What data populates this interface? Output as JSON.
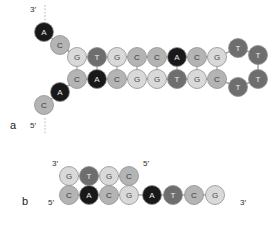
{
  "figure": {
    "panels": [
      {
        "id": "a",
        "letter": "a",
        "letter_x": 10,
        "letter_y": 129,
        "description": "hairpin with single-stranded fork arms",
        "labels": [
          {
            "name": "three-prime-label-a",
            "text": "3′",
            "x": 30,
            "y": 12
          },
          {
            "name": "five-prime-label-a",
            "text": "5′",
            "x": 30,
            "y": 128
          }
        ],
        "dashes": [
          {
            "name": "three-prime-dash-a",
            "x1": 45,
            "y1": 5,
            "x2": 45,
            "y2": 22
          },
          {
            "name": "five-prime-dash-a",
            "x1": 45,
            "y1": 118,
            "x2": 45,
            "y2": 135
          }
        ],
        "bases": [
          {
            "id": "a-t1",
            "base": "A",
            "x": 44,
            "y": 32
          },
          {
            "id": "a-t2",
            "base": "C",
            "x": 60,
            "y": 45
          },
          {
            "id": "a-t3",
            "base": "G",
            "x": 77,
            "y": 57
          },
          {
            "id": "a-t4",
            "base": "T",
            "x": 97,
            "y": 57
          },
          {
            "id": "a-t5",
            "base": "G",
            "x": 117,
            "y": 57
          },
          {
            "id": "a-t6",
            "base": "C",
            "x": 137,
            "y": 57
          },
          {
            "id": "a-t7",
            "base": "C",
            "x": 157,
            "y": 57
          },
          {
            "id": "a-t8",
            "base": "A",
            "x": 177,
            "y": 57
          },
          {
            "id": "a-t9",
            "base": "C",
            "x": 197,
            "y": 57
          },
          {
            "id": "a-t10",
            "base": "G",
            "x": 217,
            "y": 57
          },
          {
            "id": "a-l1",
            "base": "T",
            "x": 238,
            "y": 48
          },
          {
            "id": "a-l2",
            "base": "T",
            "x": 258,
            "y": 55
          },
          {
            "id": "a-l3",
            "base": "T",
            "x": 258,
            "y": 79
          },
          {
            "id": "a-l4",
            "base": "T",
            "x": 238,
            "y": 87
          },
          {
            "id": "a-b10",
            "base": "C",
            "x": 217,
            "y": 79
          },
          {
            "id": "a-b9",
            "base": "G",
            "x": 197,
            "y": 79
          },
          {
            "id": "a-b8",
            "base": "T",
            "x": 177,
            "y": 79
          },
          {
            "id": "a-b7",
            "base": "G",
            "x": 157,
            "y": 79
          },
          {
            "id": "a-b6",
            "base": "G",
            "x": 137,
            "y": 79
          },
          {
            "id": "a-b5",
            "base": "C",
            "x": 117,
            "y": 79
          },
          {
            "id": "a-b4",
            "base": "A",
            "x": 97,
            "y": 79
          },
          {
            "id": "a-b3",
            "base": "C",
            "x": 77,
            "y": 79
          },
          {
            "id": "a-b2",
            "base": "A",
            "x": 60,
            "y": 92
          },
          {
            "id": "a-b1",
            "base": "C",
            "x": 44,
            "y": 105
          }
        ],
        "backbone": [
          [
            "a-t1",
            "a-t2"
          ],
          [
            "a-t2",
            "a-t3"
          ],
          [
            "a-t3",
            "a-t4"
          ],
          [
            "a-t4",
            "a-t5"
          ],
          [
            "a-t5",
            "a-t6"
          ],
          [
            "a-t6",
            "a-t7"
          ],
          [
            "a-t7",
            "a-t8"
          ],
          [
            "a-t8",
            "a-t9"
          ],
          [
            "a-t9",
            "a-t10"
          ],
          [
            "a-t10",
            "a-l1"
          ],
          [
            "a-l1",
            "a-l2"
          ],
          [
            "a-l2",
            "a-l3"
          ],
          [
            "a-l3",
            "a-l4"
          ],
          [
            "a-l4",
            "a-b10"
          ],
          [
            "a-b10",
            "a-b9"
          ],
          [
            "a-b9",
            "a-b8"
          ],
          [
            "a-b8",
            "a-b7"
          ],
          [
            "a-b7",
            "a-b6"
          ],
          [
            "a-b6",
            "a-b5"
          ],
          [
            "a-b5",
            "a-b4"
          ],
          [
            "a-b4",
            "a-b3"
          ],
          [
            "a-b3",
            "a-b2"
          ],
          [
            "a-b2",
            "a-b1"
          ]
        ],
        "pairs": [
          [
            "a-t3",
            "a-b3"
          ],
          [
            "a-t4",
            "a-b4"
          ],
          [
            "a-t5",
            "a-b5"
          ],
          [
            "a-t6",
            "a-b6"
          ],
          [
            "a-t7",
            "a-b7"
          ],
          [
            "a-t8",
            "a-b8"
          ],
          [
            "a-t9",
            "a-b9"
          ],
          [
            "a-t10",
            "a-b10"
          ]
        ],
        "top_strand_sequence": "ACGTGCCACG",
        "bottom_strand_sequence": "CACGGTGCTTTT",
        "loop_sequence": "TTTT"
      },
      {
        "id": "b",
        "letter": "b",
        "letter_x": 22,
        "letter_y": 205,
        "description": "short duplex with single-stranded 3 prime overhang",
        "labels": [
          {
            "name": "three-prime-label-b-top",
            "text": "3′",
            "x": 52,
            "y": 166
          },
          {
            "name": "five-prime-label-b-top",
            "text": "5′",
            "x": 143,
            "y": 166
          },
          {
            "name": "five-prime-label-b-bottom",
            "text": "5′",
            "x": 48,
            "y": 205
          },
          {
            "name": "three-prime-label-b-bottom",
            "text": "3′",
            "x": 240,
            "y": 205
          }
        ],
        "dashes": [],
        "bases": [
          {
            "id": "b-t1",
            "base": "G",
            "x": 69,
            "y": 176
          },
          {
            "id": "b-t2",
            "base": "T",
            "x": 89,
            "y": 176
          },
          {
            "id": "b-t3",
            "base": "G",
            "x": 109,
            "y": 176
          },
          {
            "id": "b-t4",
            "base": "C",
            "x": 129,
            "y": 176
          },
          {
            "id": "b-b1",
            "base": "C",
            "x": 69,
            "y": 195
          },
          {
            "id": "b-b2",
            "base": "A",
            "x": 89,
            "y": 195
          },
          {
            "id": "b-b3",
            "base": "C",
            "x": 109,
            "y": 195
          },
          {
            "id": "b-b4",
            "base": "G",
            "x": 129,
            "y": 195
          },
          {
            "id": "b-b5",
            "base": "A",
            "x": 152,
            "y": 195
          },
          {
            "id": "b-b6",
            "base": "T",
            "x": 173,
            "y": 195
          },
          {
            "id": "b-b7",
            "base": "C",
            "x": 194,
            "y": 195
          },
          {
            "id": "b-b8",
            "base": "G",
            "x": 215,
            "y": 195
          }
        ],
        "backbone": [
          [
            "b-t1",
            "b-t2"
          ],
          [
            "b-t2",
            "b-t3"
          ],
          [
            "b-t3",
            "b-t4"
          ],
          [
            "b-b1",
            "b-b2"
          ],
          [
            "b-b2",
            "b-b3"
          ],
          [
            "b-b3",
            "b-b4"
          ],
          [
            "b-b4",
            "b-b5"
          ],
          [
            "b-b5",
            "b-b6"
          ],
          [
            "b-b6",
            "b-b7"
          ],
          [
            "b-b7",
            "b-b8"
          ]
        ],
        "pairs": [
          [
            "b-t1",
            "b-b1"
          ],
          [
            "b-t2",
            "b-b2"
          ],
          [
            "b-t3",
            "b-b3"
          ],
          [
            "b-t4",
            "b-b4"
          ]
        ],
        "top_strand_sequence": "GTGC",
        "bottom_strand_sequence": "CACGATCG"
      }
    ]
  },
  "legend": {
    "base_colors": {
      "A": "#191919",
      "T": "#6e6e6e",
      "C": "#b4b4b4",
      "G": "#d9d9d9"
    },
    "base_text_colors": {
      "A": "#e8e8e8",
      "T": "#f0f0f0",
      "C": "#3a3a3a",
      "G": "#4a4a4a"
    },
    "base_radius": 9.5
  }
}
